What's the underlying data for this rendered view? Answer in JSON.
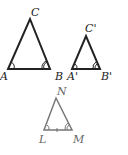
{
  "figure": {
    "triangles": [
      {
        "name": "ABC",
        "labels": {
          "top": "C",
          "left": "A",
          "right": "B"
        },
        "color": "#222222"
      },
      {
        "name": "A'B'C'",
        "labels": {
          "top": "C'",
          "left": "A'",
          "right": "B'"
        },
        "color": "#222222"
      },
      {
        "name": "LMN",
        "labels": {
          "top": "N",
          "left": "L",
          "right": "M"
        },
        "color": "#777777"
      }
    ]
  }
}
